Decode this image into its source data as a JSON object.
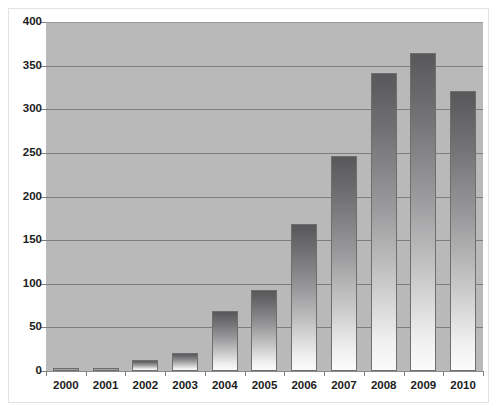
{
  "chart_data": {
    "type": "bar",
    "title": "",
    "subtitle": "",
    "xlabel": "",
    "ylabel": "",
    "categories": [
      "2000",
      "2001",
      "2002",
      "2003",
      "2004",
      "2005",
      "2006",
      "2007",
      "2008",
      "2009",
      "2010"
    ],
    "values": [
      2,
      3,
      13,
      21,
      69,
      93,
      169,
      247,
      342,
      365,
      321
    ],
    "series": [
      {
        "name": "",
        "values": [
          2,
          3,
          13,
          21,
          69,
          93,
          169,
          247,
          342,
          365,
          321
        ]
      }
    ],
    "ylim": [
      0,
      400
    ],
    "ytick_labels": [
      "0",
      "50",
      "100",
      "150",
      "200",
      "250",
      "300",
      "350",
      "400"
    ],
    "ytick_values": [
      0,
      50,
      100,
      150,
      200,
      250,
      300,
      350,
      400
    ],
    "grid": true,
    "grid_axis": "y",
    "legend": false,
    "legend_position": "none",
    "annotations": [],
    "colors": {
      "plot_background": "#b9b9b9",
      "figure_background": "#ffffff",
      "gridline": "#7e7e7e",
      "bar_gradient_top": "#58585a",
      "bar_gradient_bottom": "#fbfbfb",
      "bar_border": "#6e6e6e",
      "tick_label": "#1c1c1c",
      "figure_border": "#e2e2e2"
    }
  }
}
